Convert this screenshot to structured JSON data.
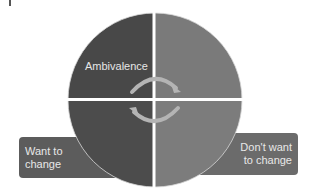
{
  "diagram": {
    "center_label": "Ambivalence",
    "left_box": {
      "lines": [
        "Want to",
        "change"
      ]
    },
    "right_box": {
      "lines": [
        "Don't want",
        "to change"
      ]
    },
    "icons": {
      "top_arrow": "curved-arrow-right-icon",
      "bottom_arrow": "curved-arrow-left-icon"
    },
    "colors": {
      "left_quadrants": "#484848",
      "right_quadrants": "#7a7a7a",
      "left_box": "#5c5c5c",
      "right_box": "#6b6b6b",
      "dividers": "#ffffff",
      "arrows": "#b4b4b4",
      "text": "#e8e8e8"
    }
  }
}
